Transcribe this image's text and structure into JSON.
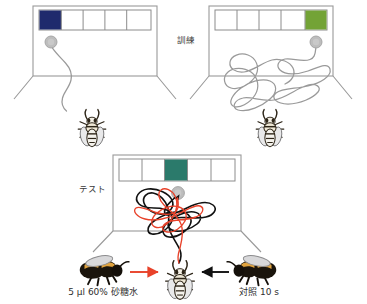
{
  "figure": {
    "panels": [
      {
        "id": "training-blue",
        "phase_label": "",
        "stimulus_color": "#1f2a6d",
        "stimulus_color_name": "navy-blue",
        "stimulus_cell_index": 1,
        "cell_count": 5,
        "path_style": "single-gray-curve",
        "bee_view": "top"
      },
      {
        "id": "training-green",
        "phase_label": "訓練",
        "stimulus_color": "#73a336",
        "stimulus_color_name": "green",
        "stimulus_cell_index": 5,
        "cell_count": 5,
        "path_style": "gray-loops",
        "bee_view": "top"
      },
      {
        "id": "test-teal",
        "phase_label": "テスト",
        "stimulus_color": "#2b7a6b",
        "stimulus_color_name": "teal",
        "stimulus_cell_index": 3,
        "cell_count": 5,
        "path_style": "black-and-red-loops",
        "bee_view": "top"
      }
    ],
    "treatments": {
      "left": {
        "label": "5 µl 60% 砂糖水",
        "arrow_color": "#e8422a",
        "arrow_direction": "right",
        "bee_view": "side"
      },
      "right": {
        "label": "対照 10 s",
        "arrow_color": "#111111",
        "arrow_direction": "left",
        "bee_view": "side"
      }
    },
    "colors": {
      "arena_line": "#9a9a9a",
      "cell_border": "#8c8c8c",
      "feeder": "#b8b8b8",
      "track_gray": "#9a9a9a",
      "track_black": "#111111",
      "track_red": "#e8422a",
      "text": "#3a3a3a",
      "background": "#ffffff"
    },
    "feeder_label": "feeder-disc"
  }
}
